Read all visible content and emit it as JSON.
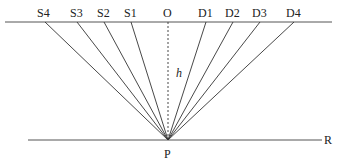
{
  "diagram": {
    "top_labels": [
      "S4",
      "S3",
      "S2",
      "S1",
      "O",
      "D1",
      "D2",
      "D3",
      "D4"
    ],
    "top_x": [
      45,
      77,
      104,
      131,
      168,
      206,
      233,
      260,
      294
    ],
    "center_label": "O",
    "depth_label": "h",
    "point_label": "P",
    "reflector_label": "R",
    "colors": {
      "line": "#333333",
      "text": "#222222"
    }
  }
}
